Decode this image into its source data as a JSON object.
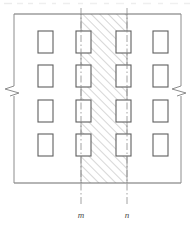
{
  "drawing": {
    "title": "Building facade elevation with wall section band",
    "type": "architectural-elevation",
    "background_color": "#ffffff",
    "line_color": "#6d6d6d",
    "window_border_color": "#5f5f5f",
    "window_fill_color": "#ffffff",
    "hatch_color": "#9a9a9a",
    "centerline_color": "#8c8c8c",
    "break_symbol_color": "#8c8c8c",
    "label_color": "#4a4a4a",
    "frame": {
      "name": "elevation-outline",
      "left_x": 14,
      "right_x": 181,
      "top_y": 14,
      "bottom_y": 183
    },
    "windows": {
      "count": 16,
      "rows": 4,
      "columns": 4,
      "width": 15,
      "height": 22,
      "column_x": [
        38,
        76,
        116,
        153
      ],
      "row_y": [
        31,
        65,
        100,
        134
      ]
    },
    "hatch_band": {
      "name": "section-hatch-band",
      "left_x": 81,
      "right_x": 127,
      "top_y": 14,
      "bottom_y": 183,
      "pattern": "diagonal-45-up",
      "spacing": 6
    },
    "centerlines": [
      {
        "id": "centerline-m",
        "label": "m",
        "x": 81,
        "top_y": 8,
        "bottom_y": 205,
        "label_x": 81,
        "label_y": 216
      },
      {
        "id": "centerline-n",
        "label": "n",
        "x": 127,
        "top_y": 8,
        "bottom_y": 205,
        "label_x": 127,
        "label_y": 216
      }
    ],
    "break_symbols": [
      {
        "id": "break-left",
        "x": 14,
        "y": 91,
        "side": "left"
      },
      {
        "id": "break-right",
        "x": 181,
        "y": 91,
        "side": "right"
      }
    ],
    "scan_artifact": {
      "name": "top-scan-noise",
      "y": 3,
      "visible": true
    }
  }
}
